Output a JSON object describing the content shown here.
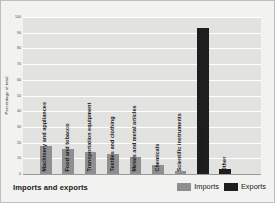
{
  "chart_data": {
    "type": "bar",
    "title": "Imports and exports",
    "xlabel": "",
    "ylabel": "Percentage of total",
    "ylim": [
      0,
      100
    ],
    "ytick_values": [
      0,
      10,
      20,
      30,
      40,
      50,
      60,
      70,
      80,
      90,
      100
    ],
    "ytick_labels": [
      "0",
      "10",
      "20",
      "30",
      "40",
      "50",
      "60",
      "70",
      "80",
      "90",
      "100"
    ],
    "grid": true,
    "grid_axis": "y",
    "legend_position": "bottom-right",
    "categories": [
      "Machinery and appliances",
      "Food and tobacco",
      "Transportation equipment",
      "Textiles and clothing",
      "Metals and metal articles",
      "Chemicals",
      "Scientific instruments",
      "Crude petroleum",
      "Other"
    ],
    "series": [
      {
        "name": "Imports",
        "color": "#8f8f8f",
        "values": [
          18,
          16,
          14,
          13,
          11,
          6,
          2,
          2,
          0
        ]
      },
      {
        "name": "Exports",
        "color": "#1e1e1e",
        "values": [
          0,
          0,
          0,
          0,
          0,
          0,
          0,
          93,
          3
        ]
      }
    ],
    "bars": [
      {
        "category": "Machinery and appliances",
        "series": "Imports",
        "value": 18
      },
      {
        "category": "Food and tobacco",
        "series": "Imports",
        "value": 16
      },
      {
        "category": "Transportation equipment",
        "series": "Imports",
        "value": 14
      },
      {
        "category": "Textiles and clothing",
        "series": "Imports",
        "value": 13
      },
      {
        "category": "Metals and metal articles",
        "series": "Imports",
        "value": 11
      },
      {
        "category": "Chemicals",
        "series": "Imports",
        "value": 6
      },
      {
        "category": "Scientific instruments",
        "series": "Imports",
        "value": 2
      },
      {
        "category": "Crude petroleum",
        "series": "Exports",
        "value": 93
      },
      {
        "category": "Other",
        "series": "Exports",
        "value": 3
      }
    ]
  },
  "legend": {
    "items": [
      {
        "label": "Imports",
        "color": "#8f8f8f"
      },
      {
        "label": "Exports",
        "color": "#1e1e1e"
      }
    ]
  },
  "colors": {
    "imports": "#8f8f8f",
    "exports": "#1e1e1e",
    "plot_background": "#e2e2e0",
    "figure_background": "#f2f2f0",
    "gridline": "#ffffff"
  }
}
